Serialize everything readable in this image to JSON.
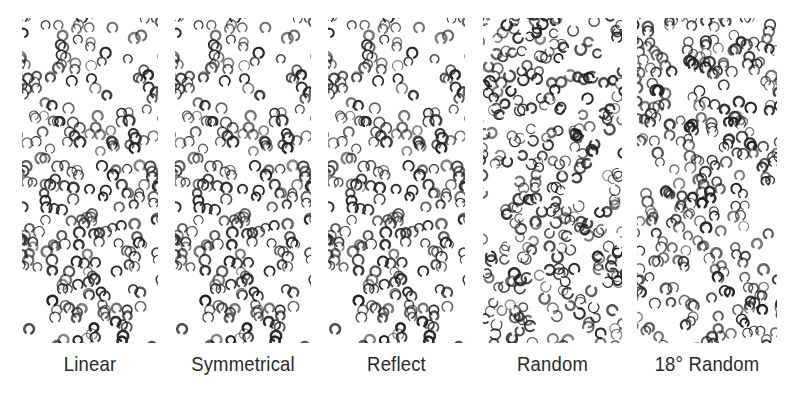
{
  "figure": {
    "glyph": "c-shape",
    "ink_color": "#222222",
    "panels": [
      {
        "id": "linear",
        "label": "Linear",
        "x": 22,
        "width": 136,
        "seed": 11,
        "mode": "linear",
        "count": 260
      },
      {
        "id": "symmetrical",
        "label": "Symmetrical",
        "x": 175,
        "width": 136,
        "seed": 11,
        "mode": "symmetrical",
        "count": 260
      },
      {
        "id": "reflect",
        "label": "Reflect",
        "x": 328,
        "width": 137,
        "seed": 11,
        "mode": "reflect",
        "count": 260
      },
      {
        "id": "random",
        "label": "Random",
        "x": 483,
        "width": 139,
        "seed": 29,
        "mode": "random",
        "count": 300
      },
      {
        "id": "random-18",
        "label": "18° Random",
        "x": 637,
        "width": 140,
        "seed": 47,
        "mode": "angled",
        "angle": 18,
        "count": 300
      }
    ]
  }
}
